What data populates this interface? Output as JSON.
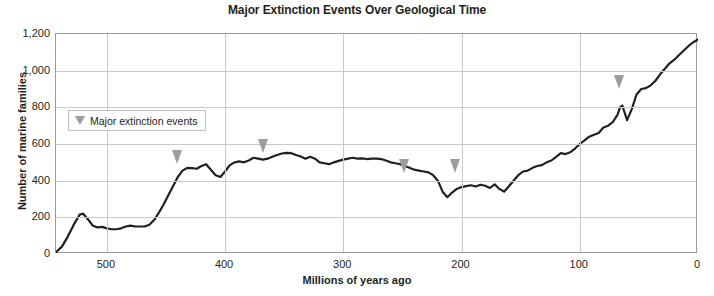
{
  "chart_data": {
    "type": "line",
    "title": "Major Extinction Events Over Geological Time",
    "xlabel": "Millions of years ago",
    "ylabel": "Number of marine families",
    "xlim": [
      543,
      0
    ],
    "ylim": [
      0,
      1200
    ],
    "x_reversed": true,
    "grid": true,
    "legend_position": "inside-upper-left",
    "legend_entries": [
      {
        "label": "Major extinction events",
        "marker": "down-triangle",
        "color": "#9d9d9d"
      }
    ],
    "xticks": [
      500,
      400,
      300,
      200,
      100,
      0
    ],
    "xtick_labels": [
      "500",
      "400",
      "300",
      "200",
      "100",
      "0"
    ],
    "yticks": [
      0,
      200,
      400,
      600,
      800,
      1000,
      1200
    ],
    "ytick_labels": [
      "0",
      "200",
      "400",
      "600",
      "800",
      "1,000",
      "1,200"
    ],
    "series": [
      {
        "name": "Number of marine families",
        "color": "#231f20",
        "x": [
          543,
          538,
          533,
          528,
          523,
          520,
          516,
          512,
          508,
          504,
          500,
          496,
          492,
          488,
          484,
          480,
          476,
          472,
          468,
          464,
          460,
          456,
          452,
          448,
          444,
          440,
          436,
          432,
          428,
          424,
          420,
          416,
          412,
          408,
          404,
          400,
          396,
          392,
          388,
          384,
          380,
          376,
          372,
          368,
          364,
          360,
          356,
          352,
          348,
          344,
          340,
          336,
          332,
          328,
          324,
          320,
          316,
          312,
          308,
          304,
          300,
          296,
          292,
          288,
          284,
          280,
          276,
          272,
          268,
          264,
          260,
          256,
          252,
          248,
          244,
          240,
          236,
          232,
          228,
          224,
          220,
          216,
          212,
          208,
          204,
          200,
          196,
          192,
          188,
          184,
          180,
          176,
          172,
          168,
          164,
          160,
          156,
          152,
          148,
          144,
          140,
          136,
          132,
          128,
          124,
          120,
          116,
          112,
          108,
          104,
          100,
          96,
          92,
          88,
          84,
          80,
          76,
          72,
          68,
          66,
          64,
          60,
          56,
          52,
          48,
          44,
          40,
          36,
          32,
          28,
          24,
          20,
          16,
          12,
          8,
          4,
          0
        ],
        "y": [
          10,
          40,
          95,
          160,
          215,
          220,
          190,
          155,
          145,
          148,
          140,
          135,
          135,
          140,
          150,
          155,
          150,
          150,
          150,
          160,
          185,
          225,
          270,
          320,
          370,
          420,
          455,
          470,
          468,
          465,
          480,
          490,
          460,
          430,
          420,
          450,
          485,
          500,
          505,
          500,
          510,
          525,
          520,
          515,
          520,
          530,
          540,
          548,
          552,
          550,
          540,
          532,
          520,
          530,
          520,
          500,
          495,
          490,
          500,
          508,
          515,
          520,
          525,
          520,
          522,
          518,
          520,
          520,
          518,
          510,
          500,
          495,
          490,
          480,
          470,
          460,
          455,
          450,
          445,
          430,
          400,
          340,
          310,
          335,
          355,
          365,
          370,
          375,
          368,
          378,
          372,
          360,
          380,
          355,
          340,
          370,
          400,
          430,
          450,
          455,
          470,
          480,
          485,
          500,
          510,
          530,
          550,
          545,
          555,
          575,
          600,
          620,
          640,
          650,
          660,
          690,
          700,
          720,
          760,
          800,
          810,
          730,
          790,
          870,
          900,
          905,
          920,
          945,
          980,
          1010,
          1040,
          1060,
          1085,
          1110,
          1135,
          1155,
          1170
        ]
      }
    ],
    "annotations": [
      {
        "name": "late-ordovician-extinction",
        "x": 440,
        "y": 470
      },
      {
        "name": "late-devonian-extinction",
        "x": 367,
        "y": 530
      },
      {
        "name": "end-permian-extinction",
        "x": 248,
        "y": 420
      },
      {
        "name": "end-triassic-extinction",
        "x": 205,
        "y": 420
      },
      {
        "name": "end-cretaceous-extinction",
        "x": 66,
        "y": 880
      }
    ]
  }
}
